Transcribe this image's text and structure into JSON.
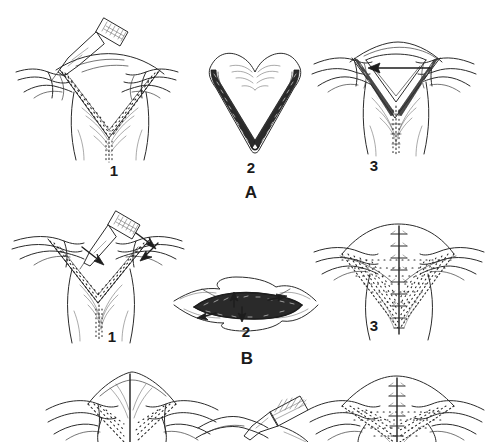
{
  "figure": {
    "background_color": "#ffffff",
    "ink_color": "#2b2b2b",
    "width": 488,
    "height": 442,
    "style": "pen-and-ink medical line drawing with stipple shading"
  },
  "sections": [
    {
      "letter": "A",
      "description": "V-shaped wedge excision of the lower lip/vermilion with primary advancement",
      "panels": [
        {
          "number": "1",
          "caption_label": "1",
          "content": "Scalpel incising a V-shaped full-thickness wedge; assistant fingers retract tissue laterally; stippled cut margins converge to midline"
        },
        {
          "number": "2",
          "caption_label": "2",
          "content": "Excised V-shaped (heart-form) specimen shown isolated, dark stippled cut edges"
        },
        {
          "number": "3",
          "caption_label": "3",
          "content": "Defect edges approximated; arrow indicates direction of flap advancement across the V"
        }
      ]
    },
    {
      "letter": "B",
      "description": "Wide shallow V excision converted to an elliptical defect and closed vertically",
      "panels": [
        {
          "number": "1",
          "caption_label": "1",
          "content": "Broad shallow V incision with scalpel; arrows mark undermining direction along both stippled limbs"
        },
        {
          "number": "2",
          "caption_label": "2",
          "content": "Lens/ellipse-shaped defect with dark stippled bed; converging arrows show closure tension"
        },
        {
          "number": "3",
          "caption_label": "3",
          "content": "Completed vertical midline suture line with interrupted sutures over stippled field"
        }
      ]
    },
    {
      "letter": "",
      "description": "Third (bottom) sequence, cropped by the image edge",
      "panels": [
        {
          "number": "",
          "caption_label": "",
          "content": "Midline-marked V defect with stippled margins, partially visible"
        },
        {
          "number": "",
          "caption_label": "",
          "content": "Scalpel approaching tissue, partially visible"
        },
        {
          "number": "",
          "caption_label": "",
          "content": "Vertical interrupted suture closure over stippled field, partially visible"
        }
      ]
    }
  ],
  "labels": {
    "a1": "1",
    "a2": "2",
    "a3": "3",
    "a_section": "A",
    "b1": "1",
    "b2": "2",
    "b3": "3",
    "b_section": "B"
  }
}
